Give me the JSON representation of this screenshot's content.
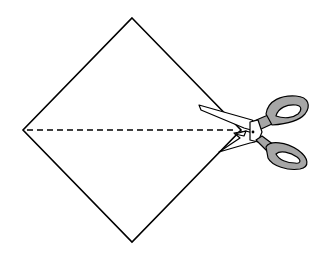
{
  "diagram": {
    "diamond": {
      "vertices": {
        "top": [
          132,
          18
        ],
        "right": [
          241,
          130
        ],
        "bottom": [
          132,
          242
        ],
        "left": [
          23,
          130
        ]
      },
      "stroke": "#000000",
      "fill": "#ffffff"
    },
    "cut_line": {
      "style": "dashed",
      "from": [
        23,
        130
      ],
      "to": [
        236,
        130
      ],
      "stroke": "#000000"
    },
    "scissors": {
      "icon": "scissors-icon",
      "handle_color": "#a6a6a6",
      "blade_color": "#ffffff",
      "outline_color": "#000000",
      "pivot": [
        253,
        131
      ]
    }
  }
}
